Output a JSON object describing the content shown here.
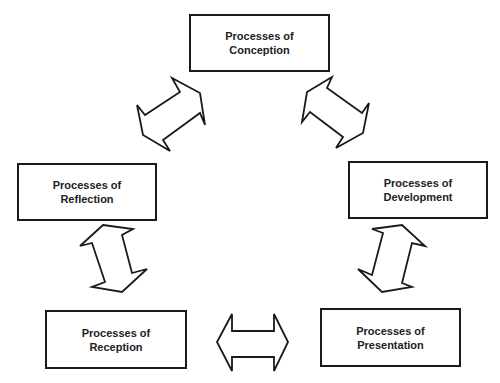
{
  "diagram": {
    "type": "cycle",
    "nodes": [
      {
        "id": "conception",
        "line1": "Processes of",
        "line2": "Conception"
      },
      {
        "id": "development",
        "line1": "Processes of",
        "line2": "Development"
      },
      {
        "id": "presentation",
        "line1": "Processes of",
        "line2": "Presentation"
      },
      {
        "id": "reception",
        "line1": "Processes of",
        "line2": "Reception"
      },
      {
        "id": "reflection",
        "line1": "Processes of",
        "line2": "Reflection"
      }
    ],
    "edges": [
      {
        "from": "conception",
        "to": "development",
        "style": "double-arrow"
      },
      {
        "from": "development",
        "to": "presentation",
        "style": "double-arrow"
      },
      {
        "from": "presentation",
        "to": "reception",
        "style": "double-arrow"
      },
      {
        "from": "reception",
        "to": "reflection",
        "style": "double-arrow"
      },
      {
        "from": "reflection",
        "to": "conception",
        "style": "double-arrow"
      }
    ]
  }
}
